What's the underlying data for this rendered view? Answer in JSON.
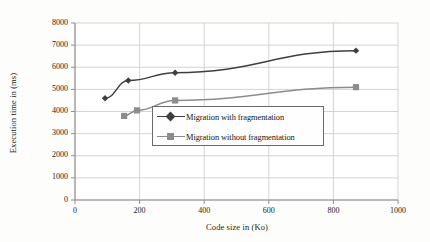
{
  "chart_data": {
    "type": "line",
    "title": "",
    "xlabel": "Code size in (Ko)",
    "ylabel": "Execution time in (ms)",
    "xlim": [
      0,
      1000
    ],
    "ylim": [
      0,
      8000
    ],
    "xticks": [
      0,
      200,
      400,
      600,
      800,
      1000
    ],
    "yticks": [
      0,
      1000,
      2000,
      3000,
      4000,
      5000,
      6000,
      7000,
      8000
    ],
    "xtick_labels": [
      "0",
      "200",
      "400",
      "600",
      "800",
      "1000"
    ],
    "ytick_labels": [
      "0",
      "1000",
      "2000",
      "3000",
      "4000",
      "5000",
      "6000",
      "7000",
      "8000"
    ],
    "grid": true,
    "grid_axis": "both",
    "legend_position": "center",
    "series": [
      {
        "name": "Migration with fragmentation",
        "marker": "diamond",
        "color": "#3f3f3f",
        "x": [
          93,
          165,
          310,
          870
        ],
        "y": [
          4600,
          5400,
          5750,
          6750
        ]
      },
      {
        "name": "Migration without fragmentation",
        "marker": "square",
        "color": "#8c8c8c",
        "x": [
          152,
          192,
          310,
          870
        ],
        "y": [
          3800,
          4050,
          4500,
          5100
        ]
      }
    ]
  },
  "legend": {
    "items": [
      {
        "label": "Migration with fragmentation"
      },
      {
        "label": "Migration without fragmentation"
      }
    ]
  },
  "colors": {
    "series1": "#3f3f3f",
    "series2": "#8c8c8c",
    "grid": "#c9c9c9",
    "axis": "#8f8f8f",
    "text": "#1a1a1a",
    "background": "#fdfdfc"
  }
}
